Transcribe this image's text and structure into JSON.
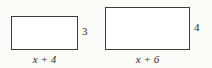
{
  "figure": {
    "background_color": "#fbfbfa",
    "stroke_color": "#3b3b3b",
    "fill_color": "#ffffff",
    "text_color": "#2b2b2b"
  },
  "shapes": [
    {
      "name": "left-rectangle",
      "type": "rectangle",
      "width_label": "x + 4",
      "height_label": "3"
    },
    {
      "name": "right-rectangle",
      "type": "rectangle",
      "width_label": "x + 6",
      "height_label": "4"
    }
  ],
  "chart_data": {
    "type": "diagram",
    "title": "",
    "shapes": [
      {
        "id": "left",
        "kind": "rectangle",
        "width_expression": "x + 4",
        "height_expression": "3",
        "pixel_width": 67,
        "pixel_height": 34
      },
      {
        "id": "right",
        "kind": "rectangle",
        "width_expression": "x + 6",
        "height_expression": "4",
        "pixel_width": 85,
        "pixel_height": 43
      }
    ],
    "annotations": [
      "x + 4",
      "3",
      "x + 6",
      "4"
    ]
  }
}
